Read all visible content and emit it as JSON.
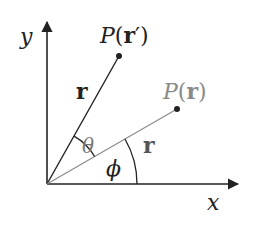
{
  "diagram": {
    "axes": {
      "x_label": "x",
      "y_label": "y"
    },
    "points": {
      "p_prime": {
        "label_prefix": "P(",
        "label_vec": "r",
        "label_suffix": "′)",
        "color": "#222222"
      },
      "p": {
        "label_prefix": "P(",
        "label_vec": "r",
        "label_suffix": ")",
        "color": "#888888"
      }
    },
    "vectors": {
      "r_prime_label": "r",
      "r_label": "r"
    },
    "angles": {
      "theta": "θ",
      "phi": "ϕ"
    },
    "colors": {
      "dark": "#222222",
      "gray": "#8a8a8a"
    }
  }
}
